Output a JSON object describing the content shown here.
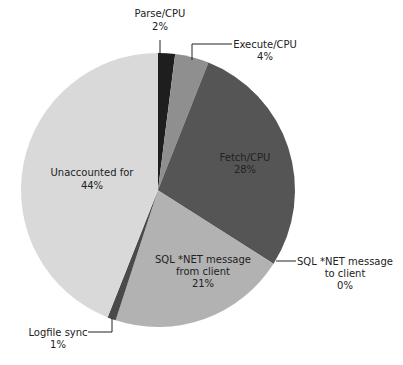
{
  "chart_data": {
    "type": "pie",
    "title": "",
    "start_angle_deg": 0,
    "direction": "clockwise",
    "slices": [
      {
        "label": "Parse/CPU",
        "value": 2,
        "display": "2%",
        "color": "#1e1e1e"
      },
      {
        "label": "Execute/CPU",
        "value": 4,
        "display": "4%",
        "color": "#8f8f8f"
      },
      {
        "label": "Fetch/CPU",
        "value": 28,
        "display": "28%",
        "color": "#555555"
      },
      {
        "label": "SQL *NET message to client",
        "value": 0,
        "display": "0%",
        "color": "#555555"
      },
      {
        "label": "SQL *NET message from client",
        "value": 21,
        "display": "21%",
        "color": "#b2b2b2"
      },
      {
        "label": "Logfile sync",
        "value": 1,
        "display": "1%",
        "color": "#4a4a4a"
      },
      {
        "label": "Unaccounted for",
        "value": 44,
        "display": "44%",
        "color": "#d9d9d9"
      }
    ],
    "legend": "none (callout labels)"
  },
  "labels": {
    "parse": {
      "name": "Parse/CPU",
      "pct": "2%"
    },
    "execute": {
      "name": "Execute/CPU",
      "pct": "4%"
    },
    "fetch": {
      "name": "Fetch/CPU",
      "pct": "28%"
    },
    "to_client": {
      "line1": "SQL *NET message",
      "line2": "to client",
      "pct": "0%"
    },
    "from_client": {
      "line1": "SQL *NET message",
      "line2": "from client",
      "pct": "21%"
    },
    "logfile": {
      "name": "Logfile sync",
      "pct": "1%"
    },
    "unaccounted": {
      "name": "Unaccounted for",
      "pct": "44%"
    }
  }
}
